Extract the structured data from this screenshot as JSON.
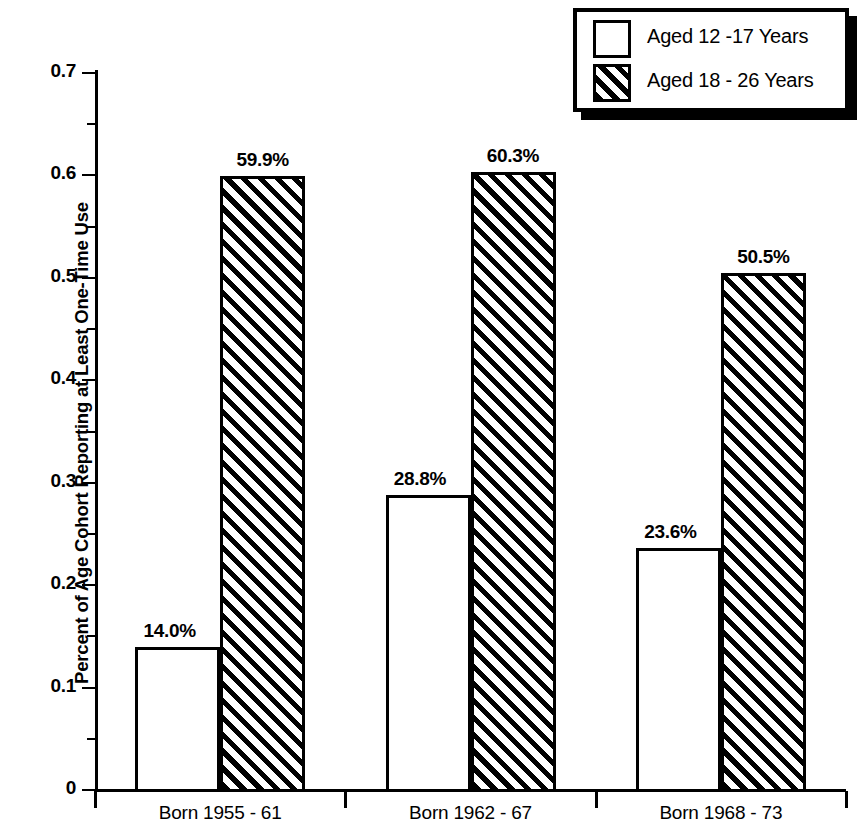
{
  "chart_data": {
    "type": "bar",
    "title": "",
    "subtitle": "",
    "xlabel": "",
    "ylabel": "Percent of Age Cohort Reporting at Least One-Time Use",
    "ylim": [
      0,
      0.7
    ],
    "grid": false,
    "legend_position": "top-right",
    "categories": [
      "Born 1955 - 61",
      "Born 1962 - 67",
      "Born 1968 - 73"
    ],
    "series": [
      {
        "name": "Aged 12 -17 Years",
        "style": "open",
        "values": [
          0.14,
          0.288,
          0.236
        ],
        "data_labels": [
          "14.0%",
          "28.8%",
          "23.6%"
        ]
      },
      {
        "name": "Aged 18 - 26 Years",
        "style": "hatched",
        "values": [
          0.599,
          0.603,
          0.505
        ],
        "data_labels": [
          "59.9%",
          "60.3%",
          "50.5%"
        ]
      }
    ],
    "y_major_ticks": [
      0,
      0.1,
      0.2,
      0.3,
      0.4,
      0.5,
      0.6,
      0.7
    ],
    "y_major_tick_labels": [
      "0",
      "0.1",
      "0.2",
      "0.3",
      "0.4",
      "0.5",
      "0.6",
      "0.7"
    ],
    "y_minor_ticks": [
      0.05,
      0.15,
      0.25,
      0.35,
      0.45,
      0.55,
      0.65
    ]
  },
  "legend": {
    "items": [
      {
        "label": "Aged 12 -17 Years",
        "style": "open"
      },
      {
        "label": "Aged 18 - 26 Years",
        "style": "hatched"
      }
    ]
  },
  "colors": {
    "ink": "#000000",
    "background": "#ffffff"
  }
}
